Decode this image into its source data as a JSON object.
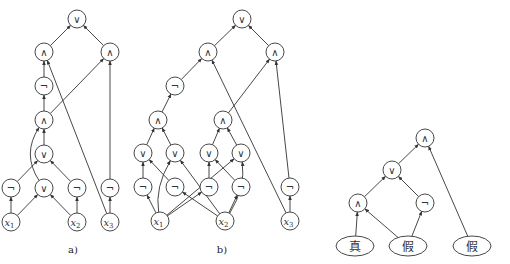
{
  "diagrams": [
    {
      "id": "a",
      "caption": "a)",
      "caption_pos": [
        73,
        253
      ],
      "nodes": [
        {
          "id": "a_or_top",
          "label": "∨",
          "x": 77,
          "y": 19
        },
        {
          "id": "a_and_l",
          "label": "∧",
          "x": 44,
          "y": 52
        },
        {
          "id": "a_and_r",
          "label": "∧",
          "x": 110,
          "y": 52
        },
        {
          "id": "a_not_mid",
          "label": "¬",
          "x": 44,
          "y": 86
        },
        {
          "id": "a_and_mid",
          "label": "∧",
          "x": 44,
          "y": 120
        },
        {
          "id": "a_or_mid",
          "label": "∨",
          "x": 44,
          "y": 154
        },
        {
          "id": "a_not_1",
          "label": "¬",
          "x": 11,
          "y": 188
        },
        {
          "id": "a_or_low",
          "label": "∨",
          "x": 44,
          "y": 188
        },
        {
          "id": "a_not_2",
          "label": "¬",
          "x": 77,
          "y": 188
        },
        {
          "id": "a_not_3",
          "label": "¬",
          "x": 110,
          "y": 188
        },
        {
          "id": "a_x1",
          "label": "x",
          "sub": "1",
          "x": 11,
          "y": 222,
          "var": true
        },
        {
          "id": "a_x2",
          "label": "x",
          "sub": "2",
          "x": 77,
          "y": 222,
          "var": true
        },
        {
          "id": "a_x3",
          "label": "x",
          "sub": "3",
          "x": 110,
          "y": 222,
          "var": true
        }
      ],
      "edges": [
        [
          "a_and_l",
          "a_or_top"
        ],
        [
          "a_and_r",
          "a_or_top"
        ],
        [
          "a_not_mid",
          "a_and_l"
        ],
        [
          "a_and_mid",
          "a_not_mid"
        ],
        [
          "a_and_mid",
          "a_and_r"
        ],
        [
          "a_x3",
          "a_and_l"
        ],
        [
          "a_not_3",
          "a_and_r"
        ],
        [
          "a_x3",
          "a_not_3"
        ],
        [
          "a_or_mid",
          "a_and_mid"
        ],
        [
          "a_not_1",
          "a_or_mid"
        ],
        [
          "a_not_2",
          "a_or_mid"
        ],
        [
          "a_x1",
          "a_not_1"
        ],
        [
          "a_x1",
          "a_or_low"
        ],
        [
          "a_x2",
          "a_or_low"
        ],
        [
          "a_x2",
          "a_not_2"
        ],
        {
          "from": "a_or_low",
          "to": "a_and_mid",
          "curve": [
            -14,
            0
          ]
        }
      ]
    },
    {
      "id": "b",
      "caption": "b)",
      "caption_pos": [
        222,
        253
      ],
      "nodes": [
        {
          "id": "b_or_top",
          "label": "∨",
          "x": 242,
          "y": 19
        },
        {
          "id": "b_and_l",
          "label": "∧",
          "x": 208,
          "y": 52
        },
        {
          "id": "b_and_r",
          "label": "∧",
          "x": 275,
          "y": 52
        },
        {
          "id": "b_not_top",
          "label": "¬",
          "x": 175,
          "y": 86
        },
        {
          "id": "b_and_1",
          "label": "∧",
          "x": 158,
          "y": 120
        },
        {
          "id": "b_and_2",
          "label": "∧",
          "x": 223,
          "y": 120
        },
        {
          "id": "b_or_1",
          "label": "∨",
          "x": 143,
          "y": 153
        },
        {
          "id": "b_or_2",
          "label": "∨",
          "x": 175,
          "y": 153
        },
        {
          "id": "b_or_3",
          "label": "∨",
          "x": 209,
          "y": 153
        },
        {
          "id": "b_or_4",
          "label": "∨",
          "x": 241,
          "y": 153
        },
        {
          "id": "b_not_1",
          "label": "¬",
          "x": 143,
          "y": 187
        },
        {
          "id": "b_not_2",
          "label": "¬",
          "x": 175,
          "y": 187
        },
        {
          "id": "b_not_3",
          "label": "¬",
          "x": 209,
          "y": 187
        },
        {
          "id": "b_not_4",
          "label": "¬",
          "x": 241,
          "y": 187
        },
        {
          "id": "b_not_5",
          "label": "¬",
          "x": 290,
          "y": 187
        },
        {
          "id": "b_x1",
          "label": "x",
          "sub": "1",
          "x": 160,
          "y": 221,
          "var": true
        },
        {
          "id": "b_x2",
          "label": "x",
          "sub": "2",
          "x": 225,
          "y": 221,
          "var": true
        },
        {
          "id": "b_x3",
          "label": "x",
          "sub": "3",
          "x": 290,
          "y": 221,
          "var": true
        }
      ],
      "edges": [
        [
          "b_and_l",
          "b_or_top"
        ],
        [
          "b_and_r",
          "b_or_top"
        ],
        [
          "b_not_top",
          "b_and_l"
        ],
        [
          "b_and_1",
          "b_not_top"
        ],
        [
          "b_and_2",
          "b_and_r"
        ],
        [
          "b_x3",
          "b_and_l"
        ],
        [
          "b_not_5",
          "b_and_r"
        ],
        [
          "b_x3",
          "b_not_5"
        ],
        [
          "b_or_1",
          "b_and_1"
        ],
        [
          "b_or_2",
          "b_and_1"
        ],
        [
          "b_or_3",
          "b_and_2"
        ],
        [
          "b_or_4",
          "b_and_2"
        ],
        [
          "b_not_1",
          "b_or_1"
        ],
        [
          "b_not_2",
          "b_or_1"
        ],
        [
          "b_not_3",
          "b_or_3"
        ],
        [
          "b_not_4",
          "b_or_3"
        ],
        [
          "b_x1",
          "b_not_1"
        ],
        [
          "b_x1",
          "b_not_3"
        ],
        [
          "b_x1",
          "b_or_4"
        ],
        [
          "b_x2",
          "b_not_2"
        ],
        [
          "b_x2",
          "b_not_4"
        ],
        [
          "b_x2",
          "b_or_2"
        ],
        {
          "from": "b_x1",
          "to": "b_or_2",
          "curve": [
            -8,
            0
          ]
        },
        {
          "from": "b_x2",
          "to": "b_or_4",
          "curve": [
            8,
            0
          ]
        },
        {
          "from": "b_x1",
          "to": "b_not_2",
          "curve": [
            0,
            0
          ],
          "skip": true
        }
      ]
    },
    {
      "id": "c",
      "caption": "",
      "nodes": [
        {
          "id": "c_and_top",
          "label": "∧",
          "x": 425,
          "y": 138
        },
        {
          "id": "c_or",
          "label": "∨",
          "x": 392,
          "y": 170
        },
        {
          "id": "c_and",
          "label": "∧",
          "x": 358,
          "y": 203
        },
        {
          "id": "c_not",
          "label": "¬",
          "x": 425,
          "y": 203
        },
        {
          "id": "c_true",
          "label": "真",
          "x": 355,
          "y": 246,
          "ellipse": true
        },
        {
          "id": "c_false1",
          "label": "假",
          "x": 408,
          "y": 246,
          "ellipse": true
        },
        {
          "id": "c_false2",
          "label": "假",
          "x": 472,
          "y": 246,
          "ellipse": true
        }
      ],
      "edges": [
        [
          "c_or",
          "c_and_top"
        ],
        [
          "c_false2",
          "c_and_top"
        ],
        [
          "c_and",
          "c_or"
        ],
        [
          "c_not",
          "c_or"
        ],
        [
          "c_true",
          "c_and"
        ],
        [
          "c_false1",
          "c_and"
        ],
        [
          "c_false1",
          "c_not"
        ]
      ]
    }
  ]
}
